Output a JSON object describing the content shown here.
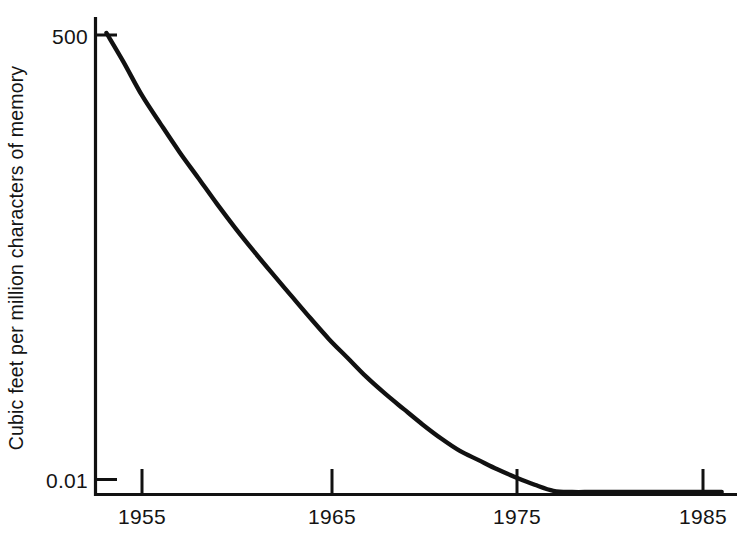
{
  "chart_data": {
    "type": "line",
    "title": "",
    "subtitle": "",
    "xlabel": "",
    "ylabel": "Cubic feet per million characters of memory",
    "x_tick_labels": [
      "1955",
      "1965",
      "1975",
      "1985"
    ],
    "x_tick_values": [
      1955,
      1965,
      1975,
      1985
    ],
    "y_tick_labels": [
      "500",
      "0.01"
    ],
    "y_tick_values": [
      500,
      0.01
    ],
    "xlim": [
      1952.5,
      1987
    ],
    "ylim": [
      0.01,
      500
    ],
    "y_scale": "log",
    "grid": false,
    "legend": null,
    "annotations": [],
    "series": [
      {
        "name": "Cubic feet per million characters of memory",
        "color": "#111111",
        "x": [
          1953.1,
          1954,
          1955,
          1956,
          1957,
          1958,
          1959,
          1960,
          1961,
          1962,
          1963,
          1964,
          1965,
          1966,
          1967,
          1968,
          1969,
          1970,
          1971,
          1972,
          1973,
          1974,
          1975,
          1976,
          1977,
          1978,
          1979,
          1980,
          1981,
          1982,
          1983,
          1984,
          1985,
          1986
        ],
        "y": [
          500,
          250,
          110,
          55,
          28,
          15,
          8,
          4.4,
          2.5,
          1.45,
          0.85,
          0.5,
          0.3,
          0.19,
          0.12,
          0.08,
          0.055,
          0.038,
          0.027,
          0.02,
          0.016,
          0.0128,
          0.0105,
          0.0088,
          0.0076,
          0.0067,
          0.0061,
          0.0057,
          0.0054,
          0.0052,
          0.0051,
          0.005,
          0.005,
          0.005
        ]
      }
    ]
  },
  "axes": {
    "y_axis_name": "vertical-axis-line",
    "x_axis_name": "horizontal-axis-line"
  },
  "labels": {
    "y_top_tick": "500",
    "y_bottom_tick": "0.01",
    "y_title": "Cubic feet per million characters of memory",
    "x_tick_1": "1955",
    "x_tick_2": "1965",
    "x_tick_3": "1975",
    "x_tick_4": "1985"
  },
  "style": {
    "background": "#ffffff",
    "ink": "#111111",
    "curve_color": "#111111"
  }
}
